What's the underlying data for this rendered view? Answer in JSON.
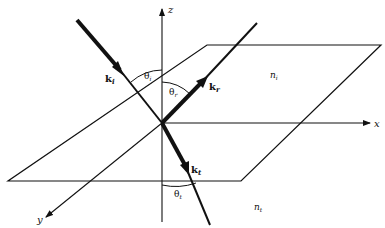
{
  "diagram": {
    "axes": {
      "x": "x",
      "y": "y",
      "z": "z"
    },
    "vectors": {
      "incident": {
        "label": "k",
        "sub": "i"
      },
      "reflected": {
        "label": "k",
        "sub": "r"
      },
      "transmitted": {
        "label": "k",
        "sub": "t"
      }
    },
    "angles": {
      "incident": {
        "label": "θ",
        "sub": "i"
      },
      "reflected": {
        "label": "θ",
        "sub": "r"
      },
      "transmitted": {
        "label": "θ",
        "sub": "t"
      }
    },
    "media": {
      "upper": {
        "label": "n",
        "sub": "i"
      },
      "lower": {
        "label": "n",
        "sub": "t"
      }
    },
    "colors": {
      "ink": "#111111",
      "background": "#ffffff"
    }
  }
}
